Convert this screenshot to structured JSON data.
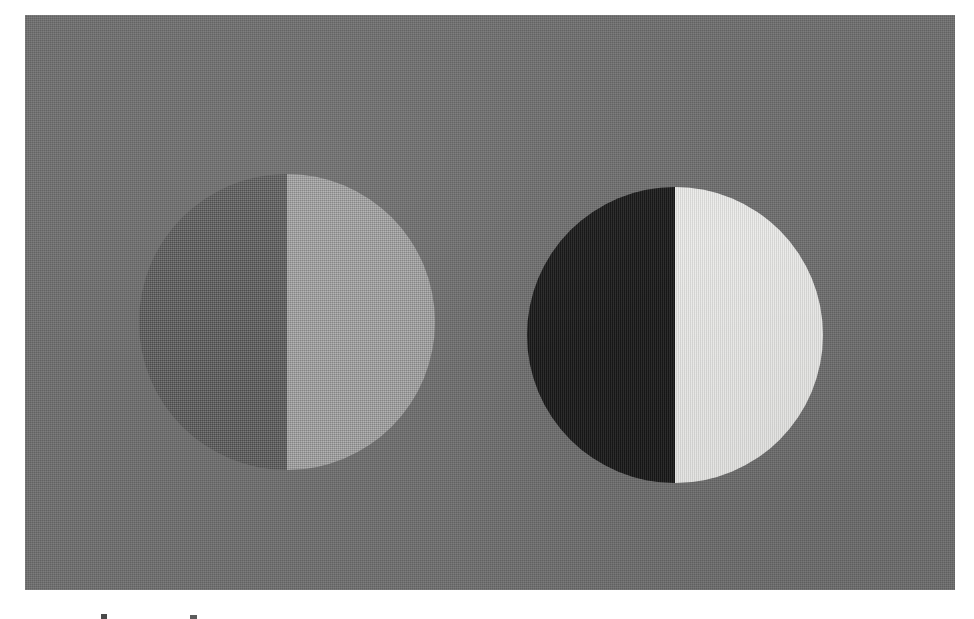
{
  "figure": {
    "title": "Simultaneous contrast demonstration: two bipartite discs on a uniform mid-gray field",
    "background_color": "#ffffff",
    "panel": {
      "name": "gray field",
      "color": "#6e6e6e",
      "x": 25,
      "y": 15,
      "width": 930,
      "height": 575,
      "texture": "halftone print grain"
    },
    "discs": [
      {
        "id": "low-contrast",
        "label": "Low-contrast disc",
        "center_x": 287,
        "center_y": 322,
        "diameter": 296,
        "left_half_color": "#5b5b5b",
        "right_half_color": "#a3a3a3",
        "left_half_label": "dark gray half",
        "right_half_label": "light gray half",
        "description": "Left half is only slightly darker than the surrounding field; right half is a light gray. The luminance step across the vertical edge is small."
      },
      {
        "id": "high-contrast",
        "label": "High-contrast disc",
        "center_x": 675,
        "center_y": 335,
        "diameter": 296,
        "left_half_color": "#0d0d0d",
        "right_half_color": "#f7f7f5",
        "left_half_label": "black half",
        "right_half_label": "white half",
        "description": "Left half is near black and right half is near white, giving a large luminance step across the vertical edge."
      }
    ],
    "caption_fragment": {
      "label": "cropped caption glyph tops",
      "note": "Only the uppermost pixels of two characters remain visible at the bottom trim of the page."
    }
  },
  "chart_data": {
    "type": "scatter",
    "title": "Simultaneous contrast demonstration: two bipartite discs on a uniform mid-gray field",
    "xlabel": "",
    "ylabel": "",
    "grid": false,
    "legend": "none",
    "background": "#6e6e6e",
    "note": "Relative luminance values are estimated from the printed gray levels (0 = black, 255 = white).",
    "categories": [
      "Field (background)",
      "Low-contrast disc: left half",
      "Low-contrast disc: right half",
      "High-contrast disc: left half",
      "High-contrast disc: right half"
    ],
    "values": [
      110,
      91,
      163,
      13,
      247
    ],
    "series": [
      {
        "name": "Gray level (0-255)",
        "values": [
          110,
          91,
          163,
          13,
          247
        ]
      },
      {
        "name": "Contrast against field (Michelson)",
        "values": [
          0.0,
          0.09,
          0.19,
          0.79,
          0.38
        ]
      }
    ],
    "ylim": [
      0,
      255
    ]
  }
}
